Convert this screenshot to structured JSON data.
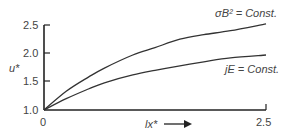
{
  "chart_data": {
    "type": "line",
    "title": "",
    "xlabel": "lx*",
    "ylabel": "u*",
    "xlim": [
      0,
      2.5
    ],
    "ylim": [
      1.0,
      2.5
    ],
    "x_ticks": [
      "0",
      "2.5"
    ],
    "y_ticks": [
      "1.0",
      "1.5",
      "2.0",
      "2.5"
    ],
    "grid": false,
    "legend": "none (inline curve annotations)",
    "x": [
      0,
      0.25,
      0.5,
      0.68,
      1.0,
      1.25,
      1.53,
      1.8,
      2.1,
      2.5
    ],
    "series": [
      {
        "name": "σB² = Const.",
        "values": [
          1.0,
          1.33,
          1.58,
          1.74,
          1.97,
          2.1,
          2.25,
          2.33,
          2.4,
          2.52
        ]
      },
      {
        "name": "jE = Const.",
        "values": [
          1.0,
          1.2,
          1.37,
          1.48,
          1.62,
          1.7,
          1.78,
          1.85,
          1.92,
          1.97
        ]
      }
    ],
    "annotations": [
      {
        "text": "σB² = Const.",
        "near": "upper curve end"
      },
      {
        "text": "jE = Const.",
        "near": "lower curve end"
      },
      {
        "text": "lx* →",
        "meaning": "x-axis direction arrow"
      }
    ]
  },
  "labels": {
    "y_axis": "u*",
    "x_axis": "lx*",
    "x0": "0",
    "xmax": "2.5",
    "y10": "1.0",
    "y15": "1.5",
    "y20": "2.0",
    "y25": "2.5",
    "upper_curve": "σB² = Const.",
    "lower_curve": "jE = Const."
  },
  "colors": {
    "axis": "#222222",
    "curve": "#333333",
    "text": "#444444"
  }
}
